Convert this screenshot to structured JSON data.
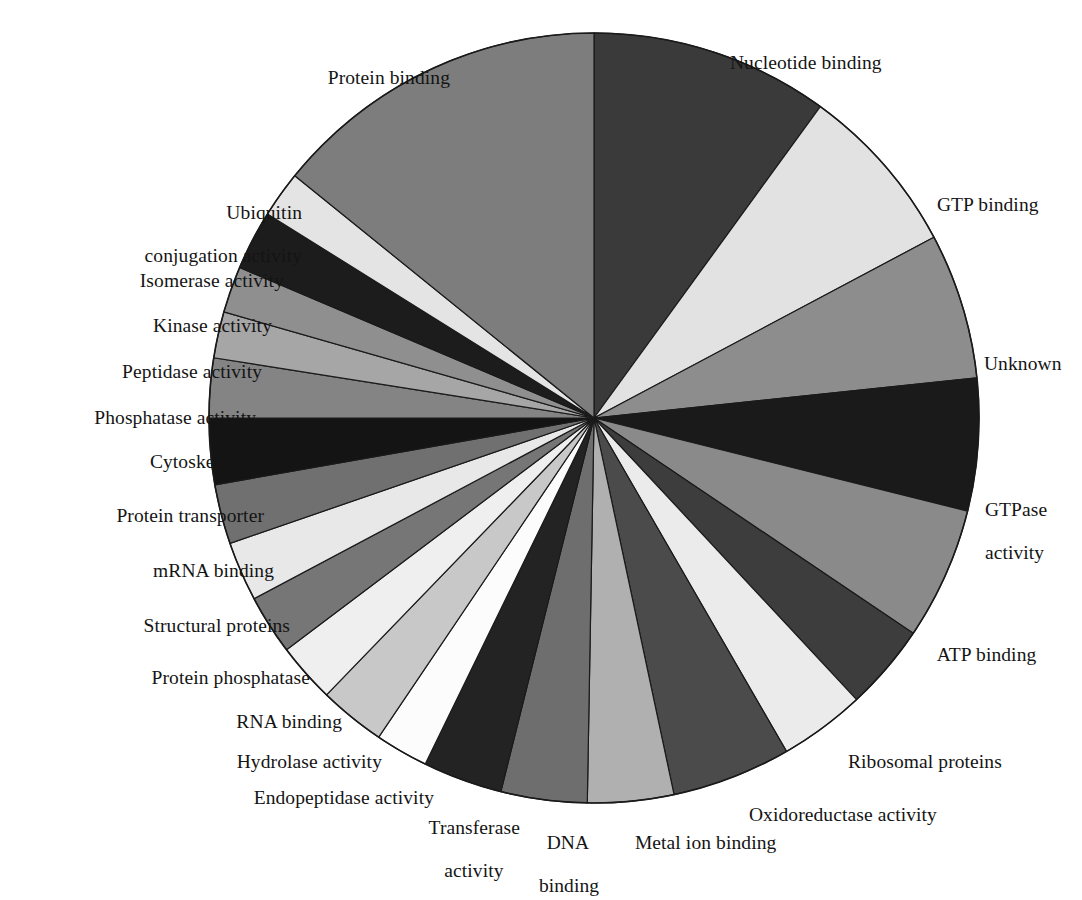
{
  "figure": {
    "kind": "pie-chart",
    "background_color": "#ffffff",
    "outline_color": "#1a1a1a",
    "label_text_color": "#141414"
  },
  "chart_data": {
    "type": "pie",
    "title": "",
    "subtitle": "",
    "xlabel": "",
    "ylabel": "",
    "legend_position": "none",
    "labels_position": "outside-callout",
    "grid": false,
    "start_angle_deg": 0,
    "direction": "clockwise",
    "units": "percent",
    "categories": [
      "Nucleotide binding",
      "GTP binding",
      "Unknown",
      "GTPase activity",
      "ATP binding",
      "Ribosomal proteins",
      "Oxidoreductase activity",
      "Metal ion binding",
      "DNA binding",
      "Transferase activity",
      "Endopeptidase activity",
      "Hydrolase activity",
      "RNA binding",
      "Protein phosphatase",
      "Structural proteins",
      "mRNA binding",
      "Protein transporter",
      "Cytoskeleton",
      "Phosphatase activity",
      "Peptidase activity",
      "Kinase activity",
      "Isomerase activity",
      "Ubiquitin conjugation activity",
      "Protein binding"
    ],
    "values": [
      10.0,
      7.2,
      6.1,
      5.6,
      5.6,
      5.0,
      3.6,
      5.0,
      3.6,
      3.6,
      3.3,
      2.2,
      2.8,
      2.5,
      2.5,
      2.5,
      2.2,
      2.8,
      2.5,
      1.9,
      1.9,
      2.5,
      1.9,
      13.3
    ],
    "slices": [
      {
        "label": "Nucleotide binding",
        "start_deg": 0.0,
        "end_deg": 36.0,
        "color": "#3a3a3a"
      },
      {
        "label": "GTP binding",
        "start_deg": 36.0,
        "end_deg": 62.0,
        "color": "#e2e2e2"
      },
      {
        "label": "Unknown",
        "start_deg": 62.0,
        "end_deg": 84.0,
        "color": "#8d8d8d"
      },
      {
        "label": "GTPase activity",
        "start_deg": 84.0,
        "end_deg": 104.0,
        "color": "#1a1a1a"
      },
      {
        "label": "ATP binding",
        "start_deg": 104.0,
        "end_deg": 124.0,
        "color": "#8a8a8a"
      },
      {
        "label": "Ribosomal proteins",
        "start_deg": 124.0,
        "end_deg": 137.0,
        "color": "#3d3d3d"
      },
      {
        "label": "Oxidoreductase activity",
        "start_deg": 137.0,
        "end_deg": 150.0,
        "color": "#ebebeb"
      },
      {
        "label": "Metal ion binding",
        "start_deg": 150.0,
        "end_deg": 168.0,
        "color": "#4b4b4b"
      },
      {
        "label": "DNA binding",
        "start_deg": 168.0,
        "end_deg": 181.0,
        "color": "#b0b0b0"
      },
      {
        "label": "Transferase activity",
        "start_deg": 181.0,
        "end_deg": 194.0,
        "color": "#6e6e6e"
      },
      {
        "label": "Endopeptidase activity",
        "start_deg": 194.0,
        "end_deg": 206.0,
        "color": "#232323"
      },
      {
        "label": "Hydrolase activity",
        "start_deg": 206.0,
        "end_deg": 214.0,
        "color": "#fcfcfc"
      },
      {
        "label": "RNA binding",
        "start_deg": 214.0,
        "end_deg": 224.0,
        "color": "#c8c8c8"
      },
      {
        "label": "Protein phosphatase",
        "start_deg": 224.0,
        "end_deg": 233.0,
        "color": "#efefef"
      },
      {
        "label": "Structural proteins",
        "start_deg": 233.0,
        "end_deg": 242.0,
        "color": "#767676"
      },
      {
        "label": "mRNA binding",
        "start_deg": 242.0,
        "end_deg": 251.0,
        "color": "#e8e8e8"
      },
      {
        "label": "Protein transporter",
        "start_deg": 251.0,
        "end_deg": 260.0,
        "color": "#707070"
      },
      {
        "label": "Cytoskeleton",
        "start_deg": 260.0,
        "end_deg": 270.0,
        "color": "#141414"
      },
      {
        "label": "Phosphatase activity",
        "start_deg": 270.0,
        "end_deg": 279.0,
        "color": "#848484"
      },
      {
        "label": "Peptidase activity",
        "start_deg": 279.0,
        "end_deg": 286.0,
        "color": "#a6a6a6"
      },
      {
        "label": "Kinase activity",
        "start_deg": 286.0,
        "end_deg": 293.0,
        "color": "#8f8f8f"
      },
      {
        "label": "Isomerase activity",
        "start_deg": 293.0,
        "end_deg": 302.0,
        "color": "#1c1c1c"
      },
      {
        "label": "Ubiquitin conjugation activity",
        "start_deg": 302.0,
        "end_deg": 309.0,
        "color": "#e4e4e4"
      },
      {
        "label": "Protein binding",
        "start_deg": 309.0,
        "end_deg": 360.0,
        "color": "#7d7d7d"
      }
    ]
  },
  "labels": {
    "nucleotide_binding": "Nucleotide binding",
    "gtp_binding": "GTP binding",
    "unknown": "Unknown",
    "gtpase_activity_l1": "GTPase",
    "gtpase_activity_l2": "activity",
    "atp_binding": "ATP binding",
    "ribosomal_proteins": "Ribosomal proteins",
    "oxidoreductase_activity": "Oxidoreductase activity",
    "metal_ion_binding": "Metal ion binding",
    "dna_binding_l1": "DNA",
    "dna_binding_l2": "binding",
    "transferase_activity_l1": "Transferase",
    "transferase_activity_l2": "activity",
    "endopeptidase_activity": "Endopeptidase activity",
    "hydrolase_activity": "Hydrolase activity",
    "rna_binding": "RNA binding",
    "protein_phosphatase": "Protein phosphatase",
    "structural_proteins": "Structural proteins",
    "mrna_binding": "mRNA binding",
    "protein_transporter": "Protein transporter",
    "cytoskeleton": "Cytoskeleton",
    "phosphatase_activity": "Phosphatase activity",
    "peptidase_activity": "Peptidase activity",
    "kinase_activity": "Kinase activity",
    "isomerase_activity": "Isomerase activity",
    "ubiquitin_l1": "Ubiquitin",
    "ubiquitin_l2": "conjugation activity",
    "protein_binding": "Protein binding"
  }
}
